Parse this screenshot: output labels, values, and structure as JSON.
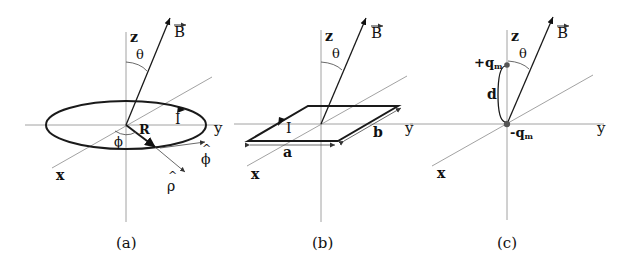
{
  "panels": [
    {
      "id": "a",
      "caption": "(a)",
      "description": "circular current loop in xy-plane",
      "labels": {
        "z": "z",
        "y": "y",
        "x": "x",
        "B": "B",
        "theta": "θ",
        "phi_angle": "ϕ",
        "R": "R",
        "I": "I",
        "phi_hat": "ϕ",
        "rho_hat": "ρ",
        "hat": "^"
      }
    },
    {
      "id": "b",
      "caption": "(b)",
      "description": "rectangular current loop in xy-plane",
      "labels": {
        "z": "z",
        "y": "y",
        "x": "x",
        "B": "B",
        "theta": "θ",
        "I": "I",
        "a": "a",
        "b": "b"
      }
    },
    {
      "id": "c",
      "caption": "(c)",
      "description": "magnetic dipole of two monopoles separated by d",
      "labels": {
        "z": "z",
        "y": "y",
        "x": "x",
        "B": "B",
        "theta": "θ",
        "d": "d",
        "plus_q": "+q",
        "minus_q": "-q",
        "sub_m": "m"
      }
    }
  ]
}
